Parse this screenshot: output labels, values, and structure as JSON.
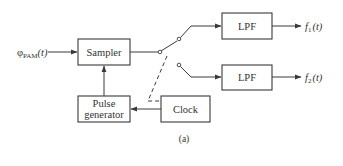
{
  "diagram": {
    "caption": "(a)",
    "input_signal": {
      "symbol": "φ",
      "subscript": "PAM",
      "arg": "(t)"
    },
    "blocks": {
      "sampler": {
        "label": "Sampler"
      },
      "pulse_generator": {
        "line1": "Pulse",
        "line2": "generator"
      },
      "clock": {
        "label": "Clock"
      },
      "lpf1": {
        "label": "LPF"
      },
      "lpf2": {
        "label": "LPF"
      }
    },
    "outputs": {
      "out1": {
        "symbol": "f",
        "subscript": "1",
        "arg": "(t)"
      },
      "out2": {
        "symbol": "f",
        "subscript": "2",
        "arg": "(t)"
      }
    },
    "connections": [
      {
        "from": "input",
        "to": "sampler"
      },
      {
        "from": "pulse_generator",
        "to": "sampler"
      },
      {
        "from": "clock",
        "to": "pulse_generator"
      },
      {
        "from": "sampler",
        "to": "switch"
      },
      {
        "from": "switch",
        "to": "lpf1"
      },
      {
        "from": "switch",
        "to": "lpf2"
      },
      {
        "from": "clock",
        "to": "switch",
        "style": "dashed"
      },
      {
        "from": "lpf1",
        "to": "out1"
      },
      {
        "from": "lpf2",
        "to": "out2"
      }
    ],
    "colors": {
      "stroke": "#3a3a3a",
      "text": "#333333",
      "background": "#ffffff"
    }
  }
}
